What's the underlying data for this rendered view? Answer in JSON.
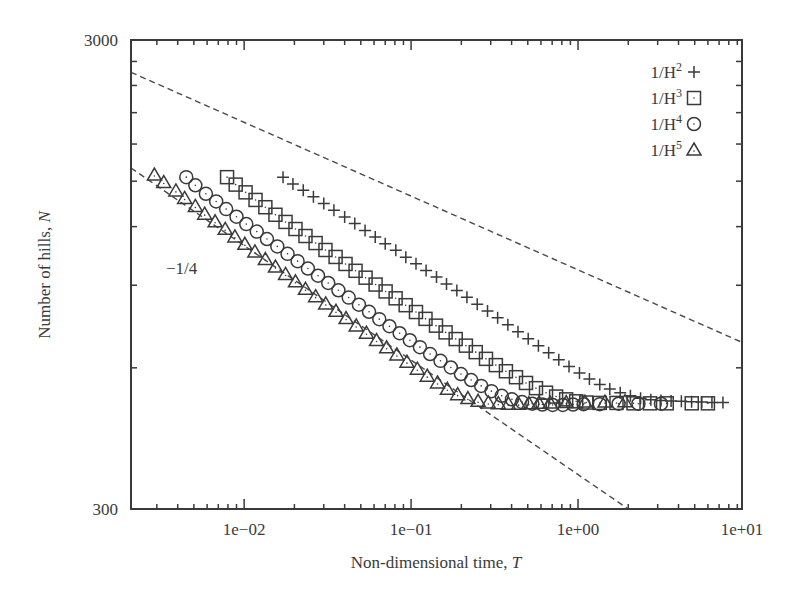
{
  "chart_data": {
    "type": "scatter",
    "title": "",
    "xlabel": "Non-dimensional time, T",
    "xlabel_main": "Non-dimensional time, ",
    "xlabel_var": "T",
    "ylabel": "Number of hills, N",
    "ylabel_main": "Number of hills, ",
    "ylabel_var": "N",
    "xscale": "log",
    "yscale": "log",
    "xlim": [
      0.0021,
      9.6
    ],
    "ylim": [
      300,
      3000
    ],
    "x_ticks": [
      {
        "value": 0.01,
        "label": "1e−02"
      },
      {
        "value": 0.1,
        "label": "1e−01"
      },
      {
        "value": 1,
        "label": "1e+00"
      },
      {
        "value": 10,
        "label": "1e+01"
      }
    ],
    "y_ticks": [
      {
        "value": 300,
        "label": "300"
      },
      {
        "value": 3000,
        "label": "3000"
      }
    ],
    "y_minor_ticks": [
      600,
      900,
      1200,
      1500,
      1800,
      2100,
      2400,
      2700
    ],
    "grid": false,
    "legend_position": "upper right",
    "annotations": [
      {
        "text": "−1/4",
        "x": 0.0055,
        "y": 850
      }
    ],
    "reference_lines": [
      {
        "name": "slope -1/4 upper",
        "style": "dashed",
        "points": [
          [
            0.0021,
            2560
          ],
          [
            9.6,
            680
          ]
        ]
      },
      {
        "name": "slope -1/4 lower",
        "style": "dashed",
        "points": [
          [
            0.0021,
            1600
          ],
          [
            2.0,
            300
          ]
        ]
      }
    ],
    "series": [
      {
        "name": "1/H2",
        "label_base": "1/H",
        "label_exp": "2",
        "marker": "plus",
        "points": [
          [
            0.0171,
            1530
          ],
          [
            0.0196,
            1480
          ],
          [
            0.0226,
            1435
          ],
          [
            0.026,
            1390
          ],
          [
            0.03,
            1345
          ],
          [
            0.0345,
            1300
          ],
          [
            0.04,
            1258
          ],
          [
            0.046,
            1218
          ],
          [
            0.053,
            1178
          ],
          [
            0.061,
            1140
          ],
          [
            0.07,
            1103
          ],
          [
            0.081,
            1068
          ],
          [
            0.093,
            1033
          ],
          [
            0.107,
            1000
          ],
          [
            0.123,
            968
          ],
          [
            0.142,
            937
          ],
          [
            0.163,
            906
          ],
          [
            0.188,
            877
          ],
          [
            0.216,
            848
          ],
          [
            0.249,
            820
          ],
          [
            0.287,
            793
          ],
          [
            0.33,
            767
          ],
          [
            0.38,
            741
          ],
          [
            0.437,
            716
          ],
          [
            0.503,
            692
          ],
          [
            0.579,
            669
          ],
          [
            0.667,
            646
          ],
          [
            0.767,
            624
          ],
          [
            0.883,
            604
          ],
          [
            1.02,
            585
          ],
          [
            1.17,
            568
          ],
          [
            1.35,
            553
          ],
          [
            1.55,
            541
          ],
          [
            1.79,
            531
          ],
          [
            2.06,
            523
          ],
          [
            2.37,
            517
          ],
          [
            2.73,
            513
          ],
          [
            3.14,
            511
          ],
          [
            3.61,
            510
          ],
          [
            4.16,
            509
          ],
          [
            4.79,
            508
          ],
          [
            5.51,
            507
          ],
          [
            6.34,
            506
          ],
          [
            7.38,
            506
          ]
        ]
      },
      {
        "name": "1/H3",
        "label_base": "1/H",
        "label_exp": "3",
        "marker": "square",
        "points": [
          [
            0.0079,
            1530
          ],
          [
            0.0089,
            1475
          ],
          [
            0.0102,
            1420
          ],
          [
            0.0117,
            1368
          ],
          [
            0.0134,
            1320
          ],
          [
            0.0154,
            1272
          ],
          [
            0.0177,
            1228
          ],
          [
            0.0203,
            1186
          ],
          [
            0.0233,
            1146
          ],
          [
            0.0268,
            1107
          ],
          [
            0.0307,
            1070
          ],
          [
            0.0353,
            1034
          ],
          [
            0.0405,
            999
          ],
          [
            0.0465,
            966
          ],
          [
            0.0534,
            934
          ],
          [
            0.0613,
            903
          ],
          [
            0.0704,
            873
          ],
          [
            0.0808,
            844
          ],
          [
            0.0928,
            816
          ],
          [
            0.107,
            789
          ],
          [
            0.122,
            763
          ],
          [
            0.141,
            738
          ],
          [
            0.161,
            714
          ],
          [
            0.185,
            691
          ],
          [
            0.213,
            669
          ],
          [
            0.244,
            648
          ],
          [
            0.281,
            627
          ],
          [
            0.322,
            608
          ],
          [
            0.37,
            590
          ],
          [
            0.425,
            573
          ],
          [
            0.488,
            557
          ],
          [
            0.56,
            543
          ],
          [
            0.643,
            531
          ],
          [
            0.739,
            521
          ],
          [
            0.849,
            514
          ],
          [
            0.975,
            509
          ],
          [
            1.12,
            506
          ],
          [
            1.35,
            505
          ],
          [
            1.7,
            505
          ],
          [
            2.15,
            504
          ],
          [
            2.7,
            504
          ],
          [
            3.4,
            504
          ],
          [
            4.8,
            504
          ],
          [
            6.0,
            504
          ]
        ]
      },
      {
        "name": "1/H4",
        "label_base": "1/H",
        "label_exp": "4",
        "marker": "circle",
        "points": [
          [
            0.0045,
            1530
          ],
          [
            0.0051,
            1470
          ],
          [
            0.0059,
            1410
          ],
          [
            0.0068,
            1358
          ],
          [
            0.0078,
            1308
          ],
          [
            0.009,
            1260
          ],
          [
            0.0103,
            1215
          ],
          [
            0.0119,
            1171
          ],
          [
            0.0137,
            1129
          ],
          [
            0.0158,
            1089
          ],
          [
            0.0182,
            1050
          ],
          [
            0.0209,
            1013
          ],
          [
            0.0241,
            977
          ],
          [
            0.0277,
            943
          ],
          [
            0.0319,
            910
          ],
          [
            0.0367,
            878
          ],
          [
            0.0423,
            847
          ],
          [
            0.0487,
            818
          ],
          [
            0.056,
            790
          ],
          [
            0.0645,
            762
          ],
          [
            0.0742,
            736
          ],
          [
            0.0854,
            711
          ],
          [
            0.0983,
            687
          ],
          [
            0.113,
            664
          ],
          [
            0.13,
            642
          ],
          [
            0.15,
            621
          ],
          [
            0.173,
            601
          ],
          [
            0.199,
            582
          ],
          [
            0.229,
            565
          ],
          [
            0.263,
            549
          ],
          [
            0.303,
            535
          ],
          [
            0.349,
            523
          ],
          [
            0.402,
            514
          ],
          [
            0.462,
            507
          ],
          [
            0.532,
            503
          ],
          [
            0.612,
            501
          ],
          [
            0.705,
            500
          ],
          [
            0.811,
            500
          ],
          [
            0.934,
            501
          ],
          [
            1.08,
            502
          ],
          [
            1.35,
            502
          ],
          [
            1.75,
            503
          ],
          [
            2.3,
            503
          ],
          [
            3.14,
            503
          ]
        ]
      },
      {
        "name": "1/H5",
        "label_base": "1/H",
        "label_exp": "5",
        "marker": "triangle",
        "points": [
          [
            0.0029,
            1546
          ],
          [
            0.0033,
            1490
          ],
          [
            0.0039,
            1430
          ],
          [
            0.0044,
            1378
          ],
          [
            0.0051,
            1325
          ],
          [
            0.0058,
            1276
          ],
          [
            0.0067,
            1229
          ],
          [
            0.0077,
            1184
          ],
          [
            0.0088,
            1141
          ],
          [
            0.0101,
            1100
          ],
          [
            0.0116,
            1060
          ],
          [
            0.0134,
            1021
          ],
          [
            0.0154,
            984
          ],
          [
            0.0177,
            949
          ],
          [
            0.0203,
            915
          ],
          [
            0.0233,
            882
          ],
          [
            0.0268,
            851
          ],
          [
            0.0308,
            821
          ],
          [
            0.0355,
            792
          ],
          [
            0.0408,
            764
          ],
          [
            0.0469,
            737
          ],
          [
            0.054,
            711
          ],
          [
            0.0621,
            686
          ],
          [
            0.0714,
            662
          ],
          [
            0.0822,
            639
          ],
          [
            0.0945,
            617
          ],
          [
            0.109,
            596
          ],
          [
            0.125,
            576
          ],
          [
            0.144,
            557
          ],
          [
            0.165,
            540
          ],
          [
            0.19,
            526
          ],
          [
            0.219,
            516
          ],
          [
            0.252,
            509
          ],
          [
            0.29,
            505
          ],
          [
            0.333,
            503
          ],
          [
            0.383,
            502
          ],
          [
            0.441,
            502
          ],
          [
            0.507,
            503
          ],
          [
            0.583,
            504
          ],
          [
            0.68,
            505
          ],
          [
            0.85,
            506
          ],
          [
            1.1,
            507
          ],
          [
            1.45,
            507
          ],
          [
            1.91,
            508
          ]
        ]
      }
    ],
    "colors": {
      "axis": "#3a3a3a",
      "marker": "#3a3a3a",
      "reference_line": "#4a4a4a",
      "background": "#ffffff"
    }
  }
}
